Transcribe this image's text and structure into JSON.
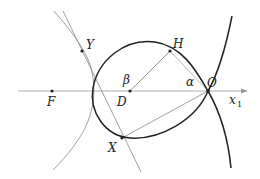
{
  "diagram": {
    "title": "",
    "axis": {
      "label": "x",
      "subscript": "1"
    },
    "points": {
      "F": {
        "label": "F"
      },
      "D": {
        "label": "D"
      },
      "O": {
        "label": "O"
      },
      "H": {
        "label": "H"
      },
      "X": {
        "label": "X"
      },
      "Y": {
        "label": "Y"
      }
    },
    "angles": {
      "alpha": {
        "label": "α"
      },
      "beta": {
        "label": "β"
      }
    },
    "colors": {
      "thick_curve": "#222222",
      "thin_lines": "#888888",
      "axis": "#999999",
      "background": "#ffffff"
    }
  }
}
